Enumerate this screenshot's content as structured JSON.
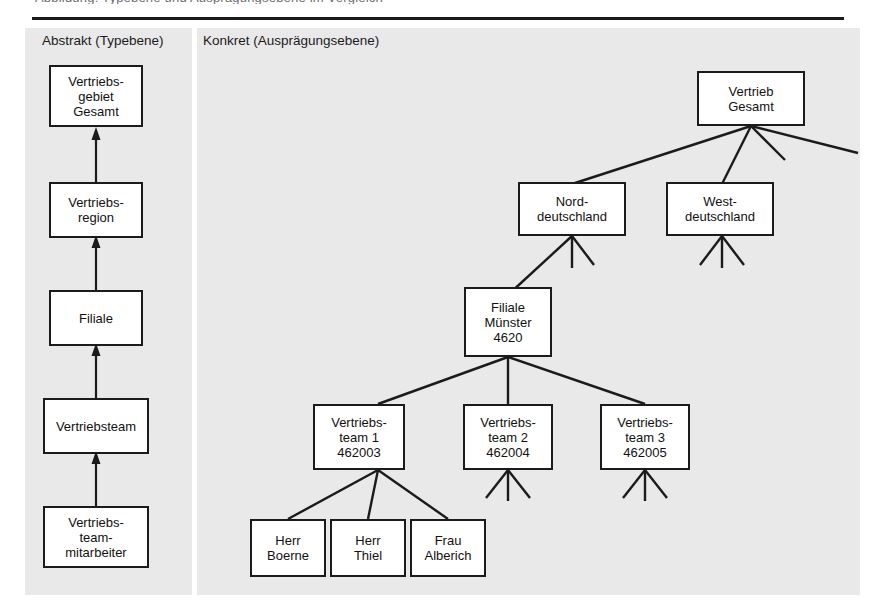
{
  "page": {
    "cropped_caption_fragment": "Abbildung: Typebene und Ausprägungsebene im Vergleich",
    "background_color": "#ffffff",
    "panel_color": "#e9e9e9",
    "line_color": "#1b1b1b"
  },
  "panels": {
    "left": {
      "title": "Abstrakt (Typebene)"
    },
    "right": {
      "title": "Konkret (Ausprägungsebene)"
    }
  },
  "abstract_nodes": [
    {
      "id": "vertriebsgebiet",
      "lines": [
        "Vertriebs-",
        "gebiet",
        "Gesamt"
      ]
    },
    {
      "id": "vertriebsregion",
      "lines": [
        "Vertriebs-",
        "region"
      ]
    },
    {
      "id": "filiale",
      "lines": [
        "Filiale"
      ]
    },
    {
      "id": "vertriebsteam",
      "lines": [
        "Vertriebsteam"
      ]
    },
    {
      "id": "vertriebsteammitarbeiter",
      "lines": [
        "Vertriebs-",
        "team-",
        "mitarbeiter"
      ]
    }
  ],
  "concrete_nodes": [
    {
      "id": "vertrieb-gesamt",
      "lines": [
        "Vertrieb",
        "Gesamt"
      ]
    },
    {
      "id": "norddeutschland",
      "lines": [
        "Nord-",
        "deutschland"
      ]
    },
    {
      "id": "westdeutschland",
      "lines": [
        "West-",
        "deutschland"
      ]
    },
    {
      "id": "filiale-muenster",
      "lines": [
        "Filiale",
        "Münster",
        "4620"
      ]
    },
    {
      "id": "vertriebsteam-1",
      "lines": [
        "Vertriebs-",
        "team 1",
        "462003"
      ]
    },
    {
      "id": "vertriebsteam-2",
      "lines": [
        "Vertriebs-",
        "team 2",
        "462004"
      ]
    },
    {
      "id": "vertriebsteam-3",
      "lines": [
        "Vertriebs-",
        "team 3",
        "462005"
      ]
    },
    {
      "id": "herr-boerne",
      "lines": [
        "Herr",
        "Boerne"
      ]
    },
    {
      "id": "herr-thiel",
      "lines": [
        "Herr",
        "Thiel"
      ]
    },
    {
      "id": "frau-alberich",
      "lines": [
        "Frau",
        "Alberich"
      ]
    }
  ]
}
